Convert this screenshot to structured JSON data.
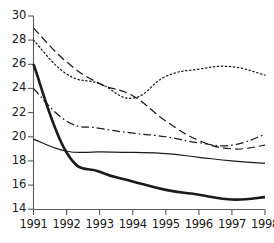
{
  "chart_data": {
    "type": "line",
    "title": "",
    "subtitle": "",
    "xlabel": "",
    "ylabel": "",
    "grid": false,
    "legend": "none",
    "categories": [
      "1991",
      "1992",
      "1993",
      "1994",
      "1995",
      "1996",
      "1997",
      "1998"
    ],
    "x": [
      1991,
      1992,
      1993,
      1994,
      1995,
      1996,
      1997,
      1998
    ],
    "xlim": [
      1991,
      1998
    ],
    "ylim": [
      14,
      30
    ],
    "ytick_labels": [
      "14",
      "16",
      "18",
      "20",
      "22",
      "24",
      "26",
      "28",
      "30"
    ],
    "yticks": [
      14,
      16,
      18,
      20,
      22,
      24,
      26,
      28,
      30
    ],
    "xtick_labels": [
      "1991",
      "1992",
      "1993",
      "1994",
      "1995",
      "1996",
      "1997",
      "1998"
    ],
    "series": [
      {
        "name": "series-thick-solid",
        "style": "solid",
        "width": "thick",
        "color": "#1a1a1a",
        "values": [
          26.0,
          18.7,
          17.1,
          16.3,
          15.6,
          15.2,
          14.8,
          15.0
        ]
      },
      {
        "name": "series-thin-solid",
        "style": "solid",
        "width": "thin",
        "color": "#1a1a1a",
        "values": [
          19.8,
          18.8,
          18.75,
          18.7,
          18.6,
          18.3,
          18.0,
          17.8
        ]
      },
      {
        "name": "series-dashed",
        "style": "dashed",
        "width": "thin",
        "color": "#1a1a1a",
        "values": [
          29.0,
          26.2,
          24.4,
          23.4,
          21.3,
          19.7,
          19.0,
          19.3
        ]
      },
      {
        "name": "series-dash-dot",
        "style": "dash-dot",
        "width": "thin",
        "color": "#1a1a1a",
        "values": [
          24.0,
          21.3,
          20.7,
          20.3,
          20.0,
          19.5,
          19.3,
          20.2
        ]
      },
      {
        "name": "series-dotted",
        "style": "dotted",
        "width": "thin",
        "color": "#1a1a1a",
        "values": [
          28.0,
          25.2,
          24.4,
          23.2,
          25.0,
          25.6,
          25.8,
          25.1
        ]
      }
    ]
  },
  "axes": {
    "y_labels": [
      "30",
      "28",
      "26",
      "24",
      "22",
      "20",
      "18",
      "16",
      "14"
    ],
    "x_labels": [
      "1991",
      "1992",
      "1993",
      "1994",
      "1995",
      "1996",
      "1997",
      "1998"
    ]
  },
  "colors": {
    "axis": "#4d4d4d",
    "line": "#1a1a1a",
    "background": "#ffffff"
  }
}
